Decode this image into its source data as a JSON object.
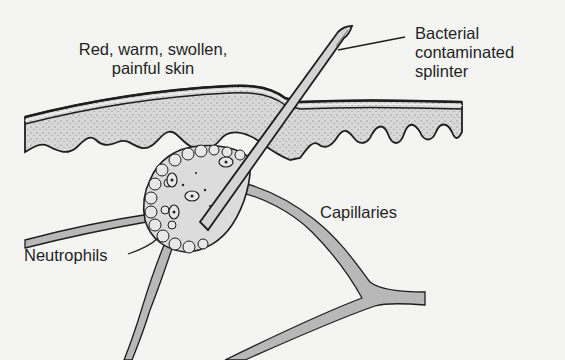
{
  "figure": {
    "labels": {
      "skin": "Red, warm, swollen,\npainful skin",
      "splinter": "Bacterial\ncontaminated\nsplinter",
      "capillaries": "Capillaries",
      "neutrophils": "Neutrophils"
    },
    "colors": {
      "background": "#f4f4f3",
      "tissue_fill": "#d9d9d9",
      "vessel_fill": "#b8b8b8",
      "splinter_fill": "#d4d4d4",
      "outline": "#1e1e1e",
      "cell_fill": "#e2e2e2"
    }
  }
}
